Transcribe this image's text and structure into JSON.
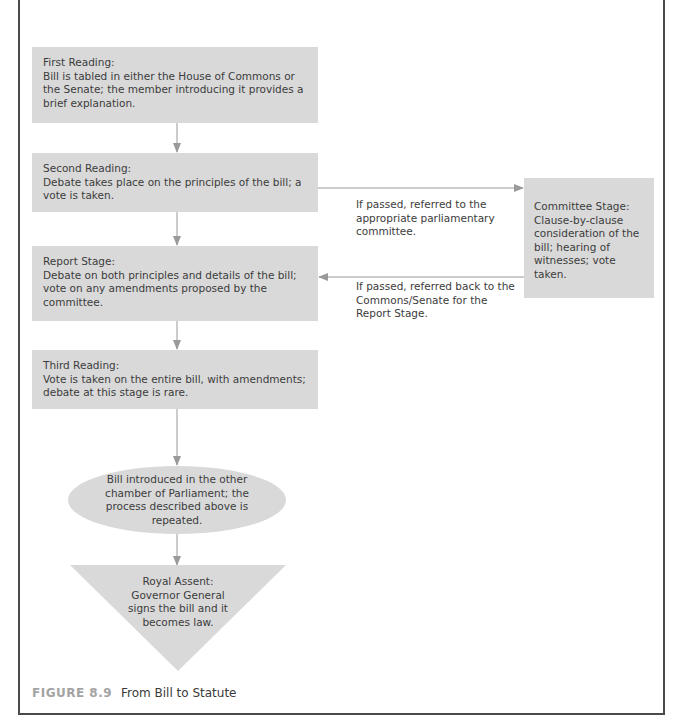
{
  "diagram": {
    "type": "flowchart",
    "colors": {
      "box_fill": "#d9d9d9",
      "arrow": "#9a9a9a",
      "border": "#4a4a4a",
      "caption_label": "#a3a3a3"
    },
    "nodes": [
      {
        "id": "first",
        "shape": "rect",
        "title": "First Reading:",
        "description": "Bill is tabled in either the House of Commons or the Senate; the member introducing it provides a brief explanation."
      },
      {
        "id": "second",
        "shape": "rect",
        "title": "Second Reading:",
        "description": "Debate takes place on the principles of the bill; a vote is taken."
      },
      {
        "id": "committee",
        "shape": "rect",
        "title": "Committee Stage:",
        "description": "Clause-by-clause consideration of the bill; hearing of witnesses; vote taken."
      },
      {
        "id": "report",
        "shape": "rect",
        "title": "Report Stage:",
        "description": "Debate on both principles and details of the bill; vote on any amendments proposed by the committee."
      },
      {
        "id": "third",
        "shape": "rect",
        "title": "Third Reading:",
        "description": "Vote is taken on the entire bill, with amendments; debate at this stage is rare."
      },
      {
        "id": "other_chamber",
        "shape": "ellipse",
        "text": "Bill introduced in the other chamber of Parliament; the process described above is repeated."
      },
      {
        "id": "royal_assent",
        "shape": "inverted-triangle",
        "title": "Royal Assent:",
        "description": "Governor General signs the bill and it becomes law."
      }
    ],
    "edges": [
      {
        "from": "first",
        "to": "second",
        "label": ""
      },
      {
        "from": "second",
        "to": "committee",
        "label": "If passed, referred to the appropriate parliamentary committee."
      },
      {
        "from": "committee",
        "to": "report",
        "label": "If passed, referred back to the Commons/Senate for the Report Stage."
      },
      {
        "from": "second",
        "to": "report",
        "label": ""
      },
      {
        "from": "report",
        "to": "third",
        "label": ""
      },
      {
        "from": "third",
        "to": "other_chamber",
        "label": ""
      },
      {
        "from": "other_chamber",
        "to": "royal_assent",
        "label": ""
      }
    ]
  },
  "caption": {
    "label": "FIGURE 8.9",
    "title": "From Bill to Statute"
  }
}
